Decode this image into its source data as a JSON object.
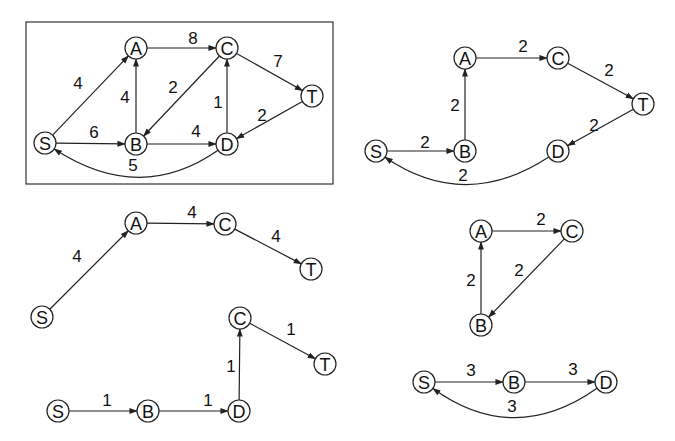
{
  "figure": {
    "node_radius": 11,
    "stroke_color": "#222222",
    "background": "#ffffff"
  },
  "graphs": [
    {
      "id": "original-network",
      "framed": true,
      "frame": {
        "x": 26,
        "y": 22,
        "w": 307,
        "h": 162
      },
      "nodes": [
        {
          "id": "S",
          "label": "S",
          "x": 45,
          "y": 143
        },
        {
          "id": "A",
          "label": "A",
          "x": 136,
          "y": 48
        },
        {
          "id": "B",
          "label": "B",
          "x": 136,
          "y": 144
        },
        {
          "id": "C",
          "label": "C",
          "x": 227,
          "y": 48
        },
        {
          "id": "D",
          "label": "D",
          "x": 227,
          "y": 144
        },
        {
          "id": "T",
          "label": "T",
          "x": 312,
          "y": 96
        }
      ],
      "edges": [
        {
          "from": "S",
          "to": "A",
          "weight": "4",
          "lx": 78,
          "ly": 83
        },
        {
          "from": "A",
          "to": "C",
          "weight": "8",
          "lx": 193,
          "ly": 38
        },
        {
          "from": "C",
          "to": "T",
          "weight": "7",
          "lx": 278,
          "ly": 61
        },
        {
          "from": "B",
          "to": "A",
          "weight": "4",
          "lx": 125,
          "ly": 97
        },
        {
          "from": "C",
          "to": "B",
          "weight": "2",
          "lx": 173,
          "ly": 87
        },
        {
          "from": "D",
          "to": "C",
          "weight": "1",
          "lx": 218,
          "ly": 102
        },
        {
          "from": "T",
          "to": "D",
          "weight": "2",
          "lx": 262,
          "ly": 115
        },
        {
          "from": "S",
          "to": "B",
          "weight": "6",
          "lx": 94,
          "ly": 132
        },
        {
          "from": "B",
          "to": "D",
          "weight": "4",
          "lx": 196,
          "ly": 131
        },
        {
          "from": "D",
          "to": "S",
          "weight": "5",
          "lx": 133,
          "ly": 165,
          "curve": {
            "cx": 140,
            "cy": 205
          }
        }
      ]
    },
    {
      "id": "cycle-flow-2",
      "framed": false,
      "nodes": [
        {
          "id": "S",
          "label": "S",
          "x": 376,
          "y": 151
        },
        {
          "id": "B",
          "label": "B",
          "x": 465,
          "y": 151
        },
        {
          "id": "A",
          "label": "A",
          "x": 465,
          "y": 58
        },
        {
          "id": "C",
          "label": "C",
          "x": 558,
          "y": 58
        },
        {
          "id": "T",
          "label": "T",
          "x": 643,
          "y": 104
        },
        {
          "id": "D",
          "label": "D",
          "x": 558,
          "y": 151
        }
      ],
      "edges": [
        {
          "from": "S",
          "to": "B",
          "weight": "2",
          "lx": 425,
          "ly": 142
        },
        {
          "from": "B",
          "to": "A",
          "weight": "2",
          "lx": 455,
          "ly": 105
        },
        {
          "from": "A",
          "to": "C",
          "weight": "2",
          "lx": 523,
          "ly": 46
        },
        {
          "from": "C",
          "to": "T",
          "weight": "2",
          "lx": 609,
          "ly": 70
        },
        {
          "from": "T",
          "to": "D",
          "weight": "2",
          "lx": 594,
          "ly": 125
        },
        {
          "from": "D",
          "to": "S",
          "weight": "2",
          "lx": 463,
          "ly": 175,
          "curve": {
            "cx": 465,
            "cy": 212
          }
        }
      ]
    },
    {
      "id": "path-flow-4",
      "framed": false,
      "nodes": [
        {
          "id": "S",
          "label": "S",
          "x": 42,
          "y": 317
        },
        {
          "id": "A",
          "label": "A",
          "x": 136,
          "y": 223
        },
        {
          "id": "C",
          "label": "C",
          "x": 225,
          "y": 224
        },
        {
          "id": "T",
          "label": "T",
          "x": 311,
          "y": 269
        }
      ],
      "edges": [
        {
          "from": "S",
          "to": "A",
          "weight": "4",
          "lx": 77,
          "ly": 256
        },
        {
          "from": "A",
          "to": "C",
          "weight": "4",
          "lx": 192,
          "ly": 212
        },
        {
          "from": "C",
          "to": "T",
          "weight": "4",
          "lx": 276,
          "ly": 236
        }
      ]
    },
    {
      "id": "path-flow-1",
      "framed": false,
      "nodes": [
        {
          "id": "S",
          "label": "S",
          "x": 58,
          "y": 411
        },
        {
          "id": "B",
          "label": "B",
          "x": 148,
          "y": 411
        },
        {
          "id": "D",
          "label": "D",
          "x": 239,
          "y": 411
        },
        {
          "id": "C",
          "label": "C",
          "x": 240,
          "y": 318
        },
        {
          "id": "T",
          "label": "T",
          "x": 325,
          "y": 364
        }
      ],
      "edges": [
        {
          "from": "S",
          "to": "B",
          "weight": "1",
          "lx": 107,
          "ly": 400
        },
        {
          "from": "B",
          "to": "D",
          "weight": "1",
          "lx": 208,
          "ly": 400
        },
        {
          "from": "D",
          "to": "C",
          "weight": "1",
          "lx": 231,
          "ly": 366
        },
        {
          "from": "C",
          "to": "T",
          "weight": "1",
          "lx": 291,
          "ly": 329
        }
      ]
    },
    {
      "id": "cycle-flow-2-abc",
      "framed": false,
      "nodes": [
        {
          "id": "A",
          "label": "A",
          "x": 481,
          "y": 231
        },
        {
          "id": "C",
          "label": "C",
          "x": 572,
          "y": 231
        },
        {
          "id": "B",
          "label": "B",
          "x": 481,
          "y": 325
        }
      ],
      "edges": [
        {
          "from": "A",
          "to": "C",
          "weight": "2",
          "lx": 541,
          "ly": 219
        },
        {
          "from": "C",
          "to": "B",
          "weight": "2",
          "lx": 519,
          "ly": 270
        },
        {
          "from": "B",
          "to": "A",
          "weight": "2",
          "lx": 471,
          "ly": 280
        }
      ]
    },
    {
      "id": "cycle-flow-3-sbd",
      "framed": false,
      "nodes": [
        {
          "id": "S",
          "label": "S",
          "x": 424,
          "y": 382
        },
        {
          "id": "B",
          "label": "B",
          "x": 514,
          "y": 382
        },
        {
          "id": "D",
          "label": "D",
          "x": 606,
          "y": 382
        }
      ],
      "edges": [
        {
          "from": "S",
          "to": "B",
          "weight": "3",
          "lx": 471,
          "ly": 370
        },
        {
          "from": "B",
          "to": "D",
          "weight": "3",
          "lx": 573,
          "ly": 369
        },
        {
          "from": "D",
          "to": "S",
          "weight": "3",
          "lx": 512,
          "ly": 406,
          "curve": {
            "cx": 514,
            "cy": 447
          }
        }
      ]
    }
  ]
}
